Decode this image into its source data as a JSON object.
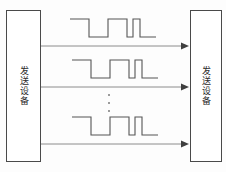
{
  "diagram": {
    "title": "",
    "background_color": "#fdfdfd",
    "line_color": "#8c8c8c",
    "signal_color": "#555555",
    "box_border_color": "#4a4a4a",
    "nodes": [
      {
        "id": "left-device",
        "label": "发送设备",
        "x": 6,
        "y": 10,
        "width": 35,
        "height": 152
      },
      {
        "id": "right-device",
        "label": "发送设备",
        "x": 190,
        "y": 10,
        "width": 32,
        "height": 152
      }
    ],
    "connections": [
      {
        "id": "channel-1",
        "y": 46,
        "x_start": 41,
        "x_end": 190,
        "arrow": "right"
      },
      {
        "id": "channel-2",
        "y": 87,
        "x_start": 41,
        "x_end": 190,
        "arrow": "right"
      },
      {
        "id": "channel-3",
        "y": 144,
        "x_start": 41,
        "x_end": 190,
        "arrow": "right"
      }
    ],
    "signals": [
      {
        "id": "signal-1",
        "baseline_high_y": 19,
        "baseline_low_y": 37,
        "points": "70,19 89,19 89,37 108,37 108,19 127,19 127,37 133,37 133,19 140,19 140,37 156,37"
      },
      {
        "id": "signal-2",
        "baseline_high_y": 60,
        "baseline_low_y": 78,
        "points": "72,60 91,60 91,78 110,78 110,60 129,60 129,78 135,78 135,60 142,60 142,78 158,78"
      },
      {
        "id": "signal-3",
        "baseline_high_y": 117,
        "baseline_low_y": 135,
        "points": "72,117 91,117 91,135 110,135 110,117 129,117 129,135 135,135 135,117 142,117 142,135 158,135"
      }
    ],
    "ellipsis": {
      "id": "vertical-ellipsis",
      "dots": 3,
      "x": 106,
      "y": 94
    }
  }
}
